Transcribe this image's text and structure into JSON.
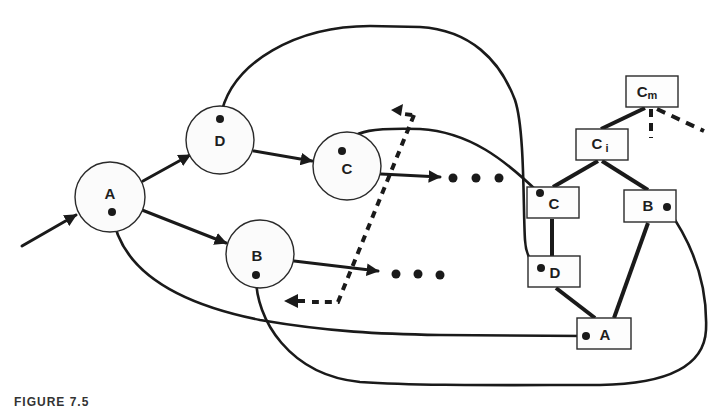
{
  "diagram": {
    "graph_nodes": {
      "A": {
        "label": "A"
      },
      "B": {
        "label": "B"
      },
      "C": {
        "label": "C"
      },
      "D": {
        "label": "D"
      }
    },
    "tree_nodes": {
      "Cm": {
        "label": "C",
        "subscript": "m"
      },
      "Ci": {
        "label": "C",
        "subscript": "i"
      },
      "C": {
        "label": "C"
      },
      "B": {
        "label": "B"
      },
      "D": {
        "label": "D"
      },
      "A": {
        "label": "A"
      }
    },
    "continuation_marker": "• • •",
    "colors": {
      "stroke": "#1a1a1a",
      "node_fill": "#fbfbfb",
      "background": "#ffffff"
    }
  },
  "caption": "FIGURE 7.5"
}
